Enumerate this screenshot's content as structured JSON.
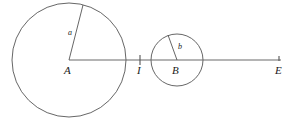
{
  "figure": {
    "width": 294,
    "height": 123,
    "background_color": "#ffffff",
    "stroke_color": "#555555",
    "text_color": "#1a1a1a",
    "points": {
      "A": {
        "label": "A",
        "x": 69,
        "y": 60,
        "label_x": 64,
        "label_y": 65
      },
      "I": {
        "label": "I",
        "x": 140,
        "y": 60,
        "label_x": 137,
        "label_y": 65
      },
      "B": {
        "label": "B",
        "x": 177,
        "y": 60,
        "label_x": 172,
        "label_y": 65
      },
      "E": {
        "label": "E",
        "x": 279,
        "y": 60,
        "label_x": 275,
        "label_y": 65
      }
    },
    "circles": [
      {
        "name": "large-circle",
        "center": "A",
        "cx": 69,
        "cy": 60,
        "r": 57
      },
      {
        "name": "small-circle",
        "center": "B",
        "cx": 177,
        "cy": 60,
        "r": 26
      }
    ],
    "radii": [
      {
        "name": "radius-a",
        "label": "a",
        "from_x": 69,
        "from_y": 60,
        "to_x": 83,
        "to_y": 5,
        "label_x": 68,
        "label_y": 29
      },
      {
        "name": "radius-b",
        "label": "b",
        "from_x": 177,
        "from_y": 60,
        "to_x": 168,
        "to_y": 35,
        "label_x": 178,
        "label_y": 43
      }
    ],
    "baseline": {
      "name": "horizontal-axis",
      "x1": 69,
      "y1": 60,
      "x2": 281,
      "y2": 60
    },
    "ticks": [
      {
        "name": "tick-I",
        "x": 140,
        "y1": 55,
        "y2": 65
      },
      {
        "name": "tick-E",
        "x": 279,
        "y1": 56,
        "y2": 61
      }
    ]
  }
}
